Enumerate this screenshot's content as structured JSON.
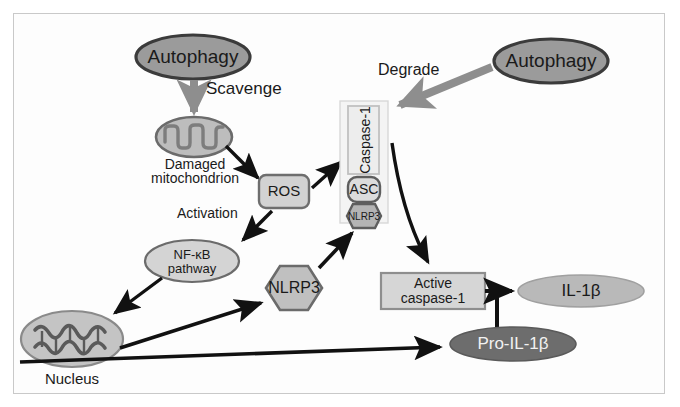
{
  "figure": {
    "background_color": "#ffffff",
    "frame_color": "#c9c9c9"
  },
  "nodes": {
    "autophagy_left": {
      "label": "Autophagy",
      "shape": "ellipse",
      "fill": "#9b9b9b",
      "stroke": "#3b3b3b",
      "text_color": "#1a1a1a"
    },
    "autophagy_right": {
      "label": "Autophagy",
      "shape": "ellipse",
      "fill": "#9b9b9b",
      "stroke": "#3b3b3b",
      "text_color": "#1a1a1a"
    },
    "mitochondrion": {
      "label": "Damaged\nmitochondrion",
      "label_line1": "Damaged",
      "label_line2": "mitochondrion",
      "shape": "mitochondrion",
      "fill": "#bdbdbd",
      "stroke": "#6b6b6b"
    },
    "ros": {
      "label": "ROS",
      "shape": "rounded-rect",
      "fill": "#d2d2d2",
      "stroke": "#6e6e6e"
    },
    "nfkb": {
      "label_line1": "NF-κB",
      "label_line2": "pathway",
      "shape": "ellipse",
      "fill": "#d4d4d4",
      "stroke": "#6b6b6b"
    },
    "nucleus": {
      "label": "Nucleus",
      "shape": "ellipse",
      "fill": "#c4c4c4",
      "stroke": "#8a8a8a",
      "dna_color": "#5a5a5a"
    },
    "nlrp3_free": {
      "label": "NLRP3",
      "shape": "hexagon",
      "fill": "#c0c0c0",
      "stroke": "#6b6b6b"
    },
    "inflammasome": {
      "container_fill": "#f4f4f4",
      "container_stroke": "#d8d8d8",
      "caspase1": {
        "label": "Caspase-1",
        "shape": "rect-vertical-text",
        "fill": "#ededed",
        "stroke": "#c0c0c0",
        "rotation_deg": -90
      },
      "asc": {
        "label": "ASC",
        "shape": "rounded-rect",
        "fill": "#dcdcdc",
        "stroke": "#5e5e5e"
      },
      "nlrp3": {
        "label": "NLRP3",
        "shape": "hexagon",
        "fill": "#b4b4b4",
        "stroke": "#5e5e5e"
      }
    },
    "active_caspase1": {
      "label_line1": "Active",
      "label_line2": "caspase-1",
      "shape": "rect",
      "fill": "#d6d6d6",
      "stroke": "#8e8e8e"
    },
    "il1b": {
      "label": "IL-1β",
      "shape": "ellipse",
      "fill": "#b9b9b9",
      "stroke": "#a0a0a0",
      "text_color": "#1a1a1a"
    },
    "pro_il1b": {
      "label": "Pro-IL-1β",
      "shape": "ellipse",
      "fill": "#6d6d6d",
      "stroke": "#5a5a5a",
      "text_color": "#f2f2f2"
    }
  },
  "edges": {
    "scavenge": {
      "label": "Scavenge",
      "style": "thick-gray-arrow",
      "color": "#8e8e8e",
      "from": "autophagy_left",
      "to": "mitochondrion"
    },
    "degrade": {
      "label": "Degrade",
      "style": "thick-gray-arrow",
      "color": "#8e8e8e",
      "from": "autophagy_right",
      "to": "inflammasome"
    },
    "activation": {
      "label": "Activation",
      "style": "black-arrow",
      "color": "#111111",
      "from": "ros",
      "to": "nfkb"
    },
    "mito_to_ros": {
      "label": "",
      "style": "black-arrow",
      "color": "#111111"
    },
    "ros_to_inflammasome": {
      "label": "",
      "style": "black-arrow",
      "color": "#111111"
    },
    "nfkb_to_nucleus": {
      "label": "",
      "style": "black-arrow",
      "color": "#111111"
    },
    "nucleus_to_nlrp3": {
      "label": "",
      "style": "black-arrow",
      "color": "#111111"
    },
    "nlrp3_to_inflammasome": {
      "label": "",
      "style": "black-arrow",
      "color": "#111111"
    },
    "inflammasome_to_active_caspase1": {
      "label": "",
      "style": "black-curved-arrow",
      "color": "#111111"
    },
    "nucleus_to_pro_il1b": {
      "label": "",
      "style": "black-arrow",
      "color": "#111111"
    },
    "pro_il1b_to_il1b": {
      "label": "",
      "style": "black-arrow-tee",
      "color": "#111111"
    }
  }
}
